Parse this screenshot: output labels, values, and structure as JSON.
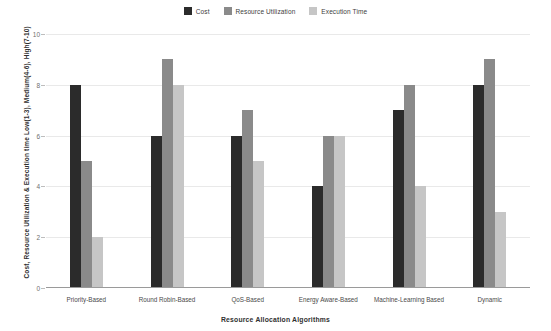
{
  "chart_data": {
    "type": "bar",
    "title": "",
    "xlabel": "Resource Allocation Algorithms",
    "ylabel": "Cost, Resource Utilization & Execution time   Low(1-3), Medium(4-6), High(7-10)",
    "categories": [
      "Priority-Based",
      "Round Robin-Based",
      "QoS-Based",
      "Energy Aware-Based",
      "Machine-Learning Based",
      "Dynamic"
    ],
    "series": [
      {
        "name": "Cost",
        "color": "#2b2b2b",
        "values": [
          8,
          6,
          6,
          4,
          7,
          8
        ]
      },
      {
        "name": "Resource Utilization",
        "color": "#8a8a8a",
        "values": [
          5,
          9,
          7,
          6,
          8,
          9
        ]
      },
      {
        "name": "Execution Time",
        "color": "#c6c6c6",
        "values": [
          2,
          8,
          5,
          6,
          4,
          3
        ]
      }
    ],
    "ylim": [
      0,
      10
    ],
    "yticks": [
      0,
      2,
      4,
      6,
      8,
      10
    ],
    "ytick_labels": [
      "0",
      "2",
      "4",
      "6",
      "8",
      "10"
    ],
    "grid": true,
    "legend_position": "top-center"
  },
  "colors": {
    "background": "#ffffff",
    "gridline": "#e9e9e9",
    "axis": "#9a9a9a",
    "tick_text": "#6f6f6f",
    "label_text": "#2f2f2f"
  }
}
